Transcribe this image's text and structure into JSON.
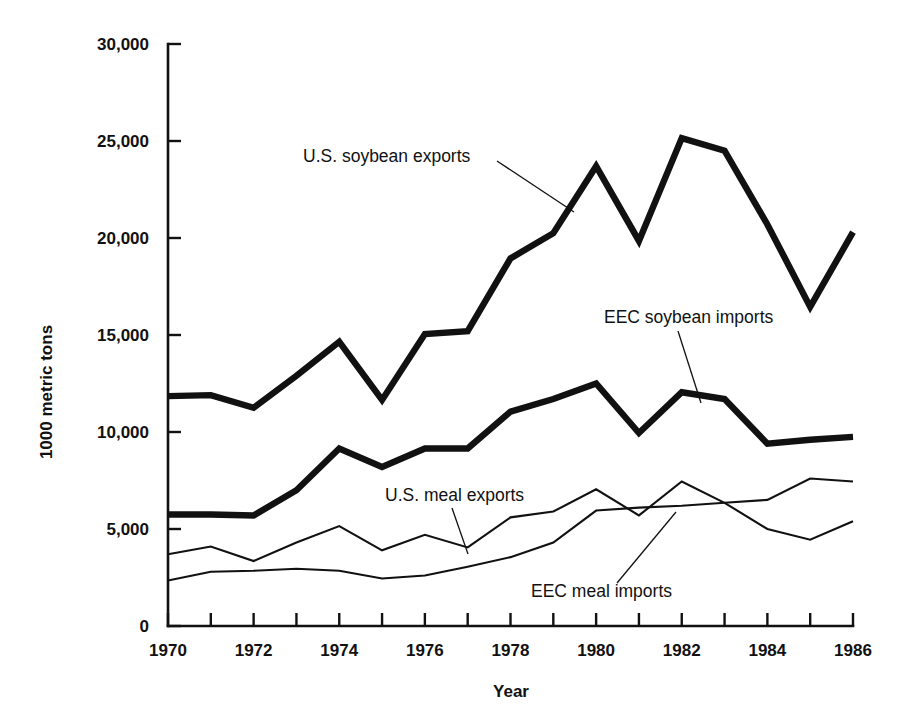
{
  "chart_data": {
    "type": "line",
    "title": "",
    "xlabel": "Year",
    "ylabel": "1000 metric tons",
    "xlim": [
      1970,
      1986
    ],
    "ylim": [
      0,
      30000
    ],
    "grid": false,
    "legend": "inline-labels",
    "x": [
      1970,
      1971,
      1972,
      1973,
      1974,
      1975,
      1976,
      1977,
      1978,
      1979,
      1980,
      1981,
      1982,
      1983,
      1984,
      1985,
      1986
    ],
    "xticks": [
      1970,
      1971,
      1972,
      1973,
      1974,
      1975,
      1976,
      1977,
      1978,
      1979,
      1980,
      1981,
      1982,
      1983,
      1984,
      1985,
      1986
    ],
    "xtick_labels": [
      "1970",
      "",
      "1972",
      "",
      "1974",
      "",
      "1976",
      "",
      "1978",
      "",
      "1980",
      "",
      "1982",
      "",
      "1984",
      "",
      "1986"
    ],
    "yticks": [
      0,
      5000,
      10000,
      15000,
      20000,
      25000,
      30000
    ],
    "ytick_labels": [
      "0",
      "5,000",
      "10,000",
      "15,000",
      "20,000",
      "25,000",
      "30,000"
    ],
    "series": [
      {
        "name": "U.S. soybean exports",
        "style": "thick",
        "values": [
          11850,
          11900,
          11250,
          12900,
          14650,
          11650,
          15050,
          15200,
          18950,
          20250,
          23700,
          19850,
          25150,
          24500,
          20700,
          16450,
          20300
        ]
      },
      {
        "name": "EEC soybean imports",
        "style": "thick",
        "values": [
          5750,
          5750,
          5700,
          7000,
          9150,
          8200,
          9150,
          9150,
          11050,
          11700,
          12500,
          9950,
          12050,
          11700,
          9400,
          9600,
          9750
        ]
      },
      {
        "name": "U.S. meal exports",
        "style": "thin",
        "values": [
          3700,
          4100,
          3350,
          4300,
          5150,
          3900,
          4700,
          4050,
          5600,
          5900,
          7050,
          5700,
          7450,
          6350,
          5000,
          4450,
          5400
        ]
      },
      {
        "name": "EEC meal imports",
        "style": "thin",
        "values": [
          2350,
          2800,
          2850,
          2950,
          2850,
          2450,
          2600,
          3050,
          3550,
          4300,
          5950,
          6100,
          6200,
          6350,
          6500,
          7600,
          7450
        ]
      }
    ]
  },
  "labels": {
    "us_soybean_exports": "U.S. soybean exports",
    "eec_soybean_imports": "EEC soybean imports",
    "us_meal_exports": "U.S. meal exports",
    "eec_meal_imports": "EEC meal imports",
    "y_axis_title": "1000 metric tons",
    "x_axis_title": "Year"
  }
}
